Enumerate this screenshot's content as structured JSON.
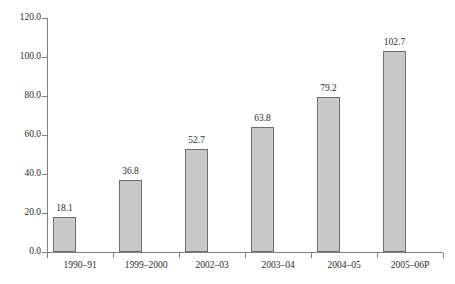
{
  "chart_data": {
    "type": "bar",
    "title": "",
    "subtitle": "",
    "xlabel": "",
    "ylabel": "",
    "categories": [
      "1990–91",
      "1999–2000",
      "2002–03",
      "2003–04",
      "2004–05",
      "2005–06P"
    ],
    "values": [
      18.1,
      36.8,
      52.7,
      63.8,
      79.2,
      102.7
    ],
    "data_labels": [
      "18.1",
      "36.8",
      "52.7",
      "63.8",
      "79.2",
      "102.7"
    ],
    "ylim": [
      0,
      120
    ],
    "y_ticks": [
      0,
      20,
      40,
      60,
      80,
      100,
      120
    ],
    "y_tick_labels": [
      "0.0",
      "20.0",
      "40.0",
      "60.0",
      "80.0",
      "100.0",
      "120.0"
    ],
    "grid": false,
    "legend": null,
    "legend_position": "none",
    "series": [
      {
        "name": "",
        "values": [
          18.1,
          36.8,
          52.7,
          63.8,
          79.2,
          102.7
        ]
      }
    ],
    "colors": {
      "bar_fill": "#c8c8c8",
      "bar_border": "#6e6e6e",
      "axis": "#808080",
      "text": "#2b2b2b",
      "background": "#ffffff"
    }
  }
}
